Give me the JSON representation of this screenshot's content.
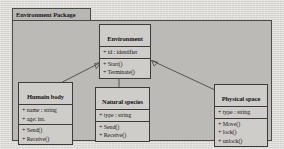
{
  "diagram": {
    "type": "uml-class-diagram",
    "package": {
      "name": "Environment Package"
    },
    "classes": [
      {
        "id": "environment",
        "name": "Environment",
        "attributes": [
          "+ id : identifier"
        ],
        "operations": [
          "+ Start()",
          "+ Terminate()"
        ]
      },
      {
        "id": "humain-body",
        "name": "Humain body",
        "attributes": [
          "+ name : string",
          "+ age: int."
        ],
        "operations": [
          "+ Send()",
          "+ Receive()"
        ]
      },
      {
        "id": "natural-species",
        "name": "Natural species",
        "attributes": [
          "+ type : string"
        ],
        "operations": [
          "+ Send()",
          "+ Receive()"
        ]
      },
      {
        "id": "physical-space",
        "name": "Physical space",
        "attributes": [
          "+ type : string"
        ],
        "operations": [
          "+ Move()",
          "+ lock()",
          "+ unlock()"
        ]
      }
    ],
    "relationships": [
      {
        "from": "humain-body",
        "to": "environment",
        "kind": "generalization"
      },
      {
        "from": "natural-species",
        "to": "environment",
        "kind": "generalization"
      },
      {
        "from": "physical-space",
        "to": "environment",
        "kind": "generalization"
      }
    ],
    "colors": {
      "page_background": "#d9d7d3",
      "package_fill": "#bcbab6",
      "package_tab_fill": "#b9b7b3",
      "class_fill": "#cfcdc9",
      "line": "#3c3c3a",
      "text": "#161616"
    }
  }
}
